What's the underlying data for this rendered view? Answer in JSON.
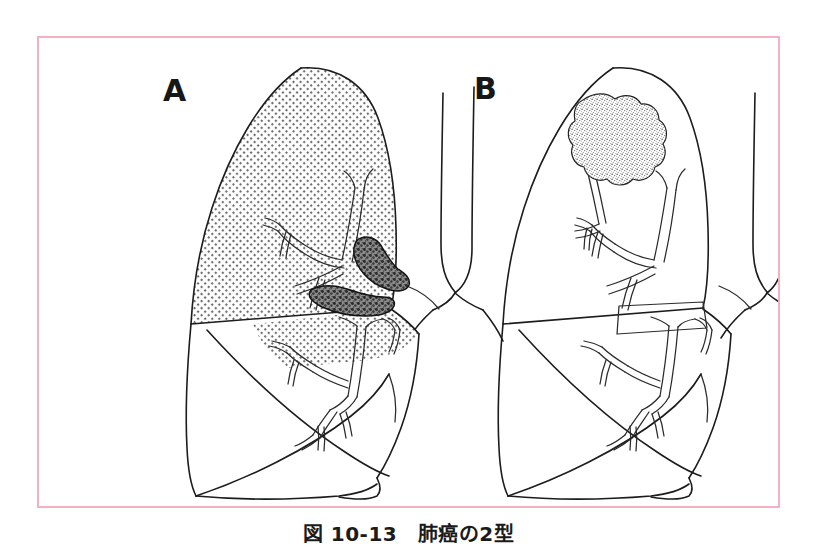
{
  "figure": {
    "caption": "図 10-13　肺癌の2型",
    "caption_number": "10-13",
    "caption_title": "肺癌の2型",
    "frame_color": "#f3b0bf",
    "background_color": "#ffffff",
    "ink_color": "#1c1c1c"
  },
  "panels": [
    {
      "letter": "A",
      "name": "central-type-lung-cancer",
      "description": "中枢型肺癌 — 肺門部気管支に発生した腫瘍と、閉塞性変化により陰影を示す上葉",
      "tumor_type": "central",
      "tumor_location": "hilar-bronchus",
      "shaded_lobe": "upper",
      "shading": "dot-screen"
    },
    {
      "letter": "B",
      "name": "peripheral-type-lung-cancer",
      "description": "末梢型肺癌 — 上葉末梢に境界不整な結節影",
      "tumor_type": "peripheral",
      "tumor_location": "upper-lobe-periphery",
      "shaded_lobe": "none",
      "shading": "none"
    }
  ],
  "anatomy": {
    "structures": [
      "trachea",
      "main-bronchus",
      "bronchial-tree",
      "upper-lobe",
      "middle-lobe",
      "lower-lobe",
      "oblique-fissure",
      "horizontal-fissure",
      "diaphragm"
    ]
  }
}
